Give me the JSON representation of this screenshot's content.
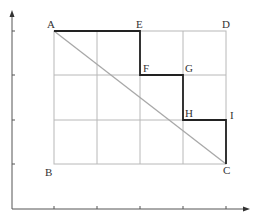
{
  "diagram": {
    "type": "grid-path",
    "colors": {
      "grid": "#b8b8b8",
      "path": "#222222",
      "diagonal": "#a8a8a8",
      "axes": "#555555",
      "label": "#333333"
    },
    "points": {
      "A": {
        "label": "A"
      },
      "B": {
        "label": "B"
      },
      "C": {
        "label": "C"
      },
      "D": {
        "label": "D"
      },
      "E": {
        "label": "E"
      },
      "F": {
        "label": "F"
      },
      "G": {
        "label": "G"
      },
      "H": {
        "label": "H"
      },
      "I": {
        "label": "I"
      }
    },
    "path_order": [
      "A",
      "E",
      "F",
      "G",
      "H",
      "I",
      "C"
    ],
    "diagonal": [
      "A",
      "C"
    ],
    "grid": {
      "columns": 4,
      "rows": 3
    },
    "axes": {
      "x_ticks": 5,
      "y_ticks": 5
    }
  }
}
